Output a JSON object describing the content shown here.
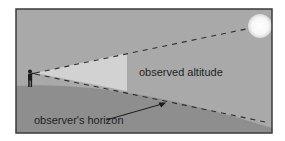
{
  "diagram": {
    "labels": {
      "altitude": "observed altitude",
      "horizon": "observer's horizon"
    },
    "elements": {
      "observer": "observer-figure",
      "celestial_body": "sun",
      "line_of_sight": "dashed line to sun",
      "horizon_line": "dashed horizon line",
      "altitude_angle": "shaded wedge"
    },
    "colors": {
      "frame_border": "#3a3a3a",
      "sky": "#a9a9a9",
      "ground": "#8e8e8e",
      "wedge": "#d2d2d2",
      "sun": "#fafafa",
      "dashes": "#2e2e2e",
      "text": "#1f1f1f"
    }
  }
}
